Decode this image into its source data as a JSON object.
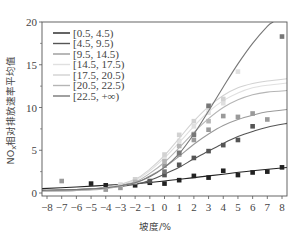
{
  "chart_data": {
    "type": "line",
    "title": "",
    "xlabel": "坡度/%",
    "ylabel": "NOx相对排放速率平均值",
    "xlim": [
      -8.6,
      8.6
    ],
    "ylim": [
      -0.4,
      20
    ],
    "xticks": [
      -8,
      -7,
      -6,
      -5,
      -4,
      -3,
      -2,
      -1,
      0,
      1,
      2,
      3,
      4,
      5,
      6,
      7,
      8
    ],
    "xtick_labels": [
      "-8",
      "-7",
      "-6",
      "-5",
      "-4",
      "-3",
      "-2",
      "-1",
      "0",
      "1",
      "2",
      "3",
      "4",
      "5",
      "6",
      "7",
      "8"
    ],
    "yticks": [
      0,
      5,
      10,
      15,
      20
    ],
    "ytick_labels": [
      "0",
      "5",
      "10",
      "15",
      "20"
    ],
    "grid": false,
    "legend_position": "upper left",
    "series": [
      {
        "name": "[0.5, 4.5)",
        "color": "#222222",
        "fit_x": [
          -8.5,
          -6,
          -4,
          -2,
          0,
          2,
          4,
          6,
          8.5
        ],
        "fit_y": [
          0.5,
          0.7,
          0.9,
          1.1,
          1.4,
          1.8,
          2.2,
          2.6,
          3.0
        ],
        "points_x": [
          -5,
          -4,
          -2,
          -1,
          0,
          1,
          2,
          3,
          4,
          5,
          6,
          7,
          8
        ],
        "points_y": [
          1.1,
          0.9,
          0.9,
          1.2,
          1.1,
          1.5,
          2.0,
          1.8,
          2.6,
          2.1,
          2.4,
          2.5,
          3.0
        ]
      },
      {
        "name": "[4.5, 9.5)",
        "color": "#555555",
        "fit_x": [
          -8.5,
          -6,
          -4,
          -2,
          -1,
          0,
          1,
          2,
          3,
          4,
          5,
          6,
          7,
          8.5
        ],
        "fit_y": [
          0.3,
          0.4,
          0.6,
          1.0,
          1.5,
          2.2,
          3.0,
          4.0,
          4.9,
          5.8,
          6.6,
          7.2,
          7.7,
          8.2
        ],
        "points_x": [
          -1,
          0,
          1,
          2,
          3,
          4,
          5,
          6
        ],
        "points_y": [
          1.4,
          2.1,
          3.3,
          4.1,
          4.9,
          5.6,
          6.2,
          7.8
        ]
      },
      {
        "name": "[9.5, 14.5)",
        "color": "#9a9a9a",
        "fit_x": [
          -8.5,
          -6,
          -4,
          -2,
          -1,
          0,
          1,
          2,
          3,
          4,
          5,
          6,
          7,
          8.5
        ],
        "fit_y": [
          0.2,
          0.3,
          0.6,
          1.2,
          2.0,
          3.0,
          4.3,
          5.7,
          6.9,
          7.9,
          8.6,
          9.1,
          9.5,
          9.8
        ],
        "points_x": [
          -7,
          -4,
          -3,
          0,
          1,
          2,
          3,
          4,
          5,
          6,
          7
        ],
        "points_y": [
          1.4,
          0.4,
          0.6,
          3.2,
          4.5,
          6.2,
          7.4,
          9.0,
          8.9,
          9.3,
          8.6
        ]
      },
      {
        "name": "[14.5, 17.5)",
        "color": "#e0e0e0",
        "fit_x": [
          -8.5,
          -6,
          -4,
          -2,
          -1,
          0,
          1,
          2,
          3,
          4,
          5,
          6,
          7,
          8.5
        ],
        "fit_y": [
          0.2,
          0.3,
          0.6,
          1.5,
          2.6,
          4.1,
          5.9,
          7.8,
          9.5,
          10.8,
          11.7,
          12.3,
          12.6,
          12.9
        ],
        "points_x": [
          -3,
          0,
          1,
          2,
          3,
          4,
          5
        ],
        "points_y": [
          1.0,
          4.0,
          6.1,
          7.8,
          9.4,
          10.5,
          14.2
        ]
      },
      {
        "name": "[17.5, 20.5)",
        "color": "#d2d2d2",
        "fit_x": [
          -8.5,
          -6,
          -4,
          -2,
          -1,
          0,
          1,
          2,
          3,
          4,
          5,
          6,
          7,
          8.5
        ],
        "fit_y": [
          0.2,
          0.3,
          0.6,
          1.6,
          2.8,
          4.4,
          6.4,
          8.4,
          10.1,
          11.4,
          12.3,
          12.8,
          13.1,
          13.4
        ],
        "points_x": [
          -2,
          0,
          1,
          2,
          3,
          4
        ],
        "points_y": [
          1.6,
          4.5,
          6.8,
          8.4,
          10.0,
          11.0
        ]
      },
      {
        "name": "[20.5, 22.5)",
        "color": "#b5b5b5",
        "fit_x": [
          -8.5,
          -6,
          -4,
          -2,
          -1,
          0,
          1,
          2,
          3,
          4,
          5,
          6,
          7,
          8.5
        ],
        "fit_y": [
          0.2,
          0.3,
          0.5,
          1.3,
          2.3,
          3.6,
          5.3,
          7.1,
          8.7,
          10.0,
          10.9,
          11.5,
          11.8,
          12.0
        ],
        "points_x": [
          -2,
          0,
          1,
          2,
          3
        ],
        "points_y": [
          1.3,
          3.7,
          5.5,
          6.9,
          8.4
        ]
      },
      {
        "name": "[22.5, +∞)",
        "color": "#777777",
        "fit_x": [
          -8.5,
          -6,
          -4,
          -2,
          -1,
          0,
          1,
          2,
          3,
          4,
          5,
          6,
          7,
          7.4
        ],
        "fit_y": [
          0.3,
          0.4,
          0.6,
          1.2,
          1.9,
          3.0,
          4.6,
          6.9,
          9.6,
          12.4,
          15.1,
          17.5,
          19.5,
          20.0
        ],
        "points_x": [
          0,
          1,
          2,
          3,
          8
        ],
        "points_y": [
          2.5,
          4.7,
          6.8,
          10.2,
          18.3
        ]
      }
    ]
  },
  "axes": {
    "xlabel": "坡度/%",
    "ylabel": "NOx相对排放速率平均值"
  },
  "legend": {
    "items": [
      "[0.5, 4.5)",
      "[4.5, 9.5)",
      "[9.5, 14.5)",
      "[14.5, 17.5)",
      "[17.5, 20.5)",
      "[20.5, 22.5)",
      "[22.5, +∞)"
    ]
  }
}
